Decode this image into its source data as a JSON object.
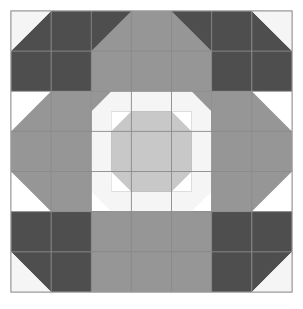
{
  "figure": {
    "kind": "quilt-block-diagram",
    "canvas": {
      "width": 303,
      "height": 309,
      "background": "#ffffff"
    }
  },
  "palette": {
    "dark_gray": "#4e4e4e",
    "medium_gray": "#969696",
    "light_gray": "#c8c8c8",
    "off_white": "#f5f5f5",
    "white": "#ffffff",
    "seam_line": "#8a8a8a",
    "border_line": "#9a9a9a"
  },
  "block": {
    "origin_x": 11,
    "origin_y": 11,
    "size": 281,
    "grid_cells": 7,
    "cell_size": 40.142857,
    "border_stroke_width": 1,
    "seam_stroke_width": 0.9
  },
  "structure": {
    "description": "Symmetric seven-by-seven cell quilt block with dark corner units, medium gray sashing, an off-white snowball ring and a light gray octagon at the center.",
    "corner_unit": "two-by-two dark gray square with off-white corner triangle",
    "edge_unit": "medium gray bar over off-white snowball",
    "center_unit": "light gray octagon on medium gray square"
  },
  "shapes": [
    {
      "name": "block-background",
      "kind": "rect",
      "fill": "#ffffff",
      "stroke": "#9a9a9a",
      "x": 11,
      "y": 11,
      "w": 281,
      "h": 281
    },
    {
      "name": "corner-tl-dark-square",
      "kind": "poly",
      "fill": "#4e4e4e",
      "points": "51.1,11 131.4,11 131.4,91.3 51.1,91.3"
    },
    {
      "name": "corner-tl-dark-wedge",
      "kind": "poly",
      "fill": "#4e4e4e",
      "points": "11,51.1 51.1,11 51.1,91.3 11,91.3"
    },
    {
      "name": "corner-tl-white-triangle",
      "kind": "poly",
      "fill": "#f5f5f5",
      "points": "11,11 51.1,11 11,51.1"
    },
    {
      "name": "corner-tl-notch-upper",
      "kind": "poly",
      "fill": "#ffffff",
      "points": "131.4,11 131.4,51.1 171.5,11"
    },
    {
      "name": "corner-tl-notch-lower",
      "kind": "poly",
      "fill": "#ffffff",
      "points": "11,91.3 51.1,91.3 11,131.4"
    },
    {
      "name": "corner-tl-dark-point-right",
      "kind": "poly",
      "fill": "#4e4e4e",
      "points": "131.4,51.1 171.5,91.3 131.4,91.3"
    },
    {
      "name": "corner-tl-dark-point-down",
      "kind": "poly",
      "fill": "#4e4e4e",
      "points": "51.1,91.3 91.3,131.4 51.1,131.4"
    },
    {
      "name": "corner-tr-dark-square",
      "kind": "poly",
      "fill": "#4e4e4e",
      "points": "171.5,11 251.8,11 251.8,91.3 171.5,91.3"
    },
    {
      "name": "corner-tr-dark-wedge",
      "kind": "poly",
      "fill": "#4e4e4e",
      "points": "251.8,11 292,51.1 292,91.3 251.8,91.3"
    },
    {
      "name": "corner-tr-white-triangle",
      "kind": "poly",
      "fill": "#f5f5f5",
      "points": "251.8,11 292,11 292,51.1"
    },
    {
      "name": "corner-tr-notch-lower",
      "kind": "poly",
      "fill": "#ffffff",
      "points": "251.8,91.3 292,91.3 292,131.4"
    },
    {
      "name": "corner-tr-dark-point-left",
      "kind": "poly",
      "fill": "#4e4e4e",
      "points": "171.5,51.1 171.5,91.3 131.4,91.3"
    },
    {
      "name": "corner-tr-dark-point-down",
      "kind": "poly",
      "fill": "#4e4e4e",
      "points": "251.8,91.3 251.8,131.4 211.6,131.4"
    },
    {
      "name": "corner-bl-dark-square",
      "kind": "poly",
      "fill": "#4e4e4e",
      "points": "51.1,211.6 131.4,211.6 131.4,292 51.1,292"
    },
    {
      "name": "corner-bl-dark-wedge",
      "kind": "poly",
      "fill": "#4e4e4e",
      "points": "11,211.6 51.1,211.6 51.1,292 11,251.8"
    },
    {
      "name": "corner-bl-white-triangle",
      "kind": "poly",
      "fill": "#f5f5f5",
      "points": "11,251.8 51.1,292 11,292"
    },
    {
      "name": "corner-bl-notch-upper",
      "kind": "poly",
      "fill": "#ffffff",
      "points": "11,171.5 51.1,211.6 11,211.6"
    },
    {
      "name": "corner-bl-dark-point-up",
      "kind": "poly",
      "fill": "#4e4e4e",
      "points": "51.1,171.5 91.3,171.5 51.1,211.6"
    },
    {
      "name": "corner-bl-dark-point-right",
      "kind": "poly",
      "fill": "#4e4e4e",
      "points": "131.4,211.6 171.5,211.6 131.4,251.8"
    },
    {
      "name": "corner-br-dark-square",
      "kind": "poly",
      "fill": "#4e4e4e",
      "points": "171.5,211.6 251.8,211.6 251.8,292 171.5,292"
    },
    {
      "name": "corner-br-dark-wedge",
      "kind": "poly",
      "fill": "#4e4e4e",
      "points": "251.8,211.6 292,211.6 292,251.8 251.8,292"
    },
    {
      "name": "corner-br-white-triangle",
      "kind": "poly",
      "fill": "#f5f5f5",
      "points": "292,251.8 292,292 251.8,292"
    },
    {
      "name": "corner-br-notch-upper",
      "kind": "poly",
      "fill": "#ffffff",
      "points": "251.8,171.5 292,171.5 292,211.6"
    },
    {
      "name": "corner-br-dark-point-up",
      "kind": "poly",
      "fill": "#4e4e4e",
      "points": "211.6,171.5 251.8,171.5 251.8,211.6"
    },
    {
      "name": "corner-br-dark-point-left",
      "kind": "poly",
      "fill": "#4e4e4e",
      "points": "131.4,211.6 171.5,251.8 131.4,251.8"
    },
    {
      "name": "edge-top-bar",
      "kind": "poly",
      "fill": "#969696",
      "points": "131.4,11 171.5,11 171.5,11 171.5,51.1 211.6,91.3 91.3,91.3 131.4,51.1"
    },
    {
      "name": "edge-top-bar-fill",
      "kind": "poly",
      "fill": "#969696",
      "points": "131.4,11 171.5,11 211.6,51.1 211.6,91.3 91.3,91.3 91.3,51.1"
    },
    {
      "name": "edge-top-snowball-bg",
      "kind": "poly",
      "fill": "#969696",
      "points": "91.3,91.3 211.6,91.3 211.6,131.4 91.3,131.4"
    },
    {
      "name": "edge-top-snowball",
      "kind": "poly",
      "fill": "#f5f5f5",
      "points": "111.4,91.3 191.5,91.3 211.6,111.4 211.6,131.4 91.3,131.4 91.3,111.4"
    },
    {
      "name": "edge-bottom-bar-fill",
      "kind": "poly",
      "fill": "#969696",
      "points": "91.3,251.8 211.6,251.8 211.6,292 171.5,292 131.4,292 91.3,292"
    },
    {
      "name": "edge-bottom-bar-top",
      "kind": "poly",
      "fill": "#969696",
      "points": "91.3,211.6 211.6,211.6 211.6,251.8 91.3,251.8"
    },
    {
      "name": "edge-bottom-snowball",
      "kind": "poly",
      "fill": "#f5f5f5",
      "points": "91.3,171.5 211.6,171.5 211.6,191.5 191.5,211.6 111.4,211.6 91.3,191.5"
    },
    {
      "name": "edge-left-bar",
      "kind": "poly",
      "fill": "#969696",
      "points": "11,131.4 51.1,91.3 91.3,91.3 91.3,211.6 51.1,211.6 11,171.5"
    },
    {
      "name": "edge-left-snowball",
      "kind": "poly",
      "fill": "#f5f5f5",
      "points": "131.4,111.4 151.5,131.4 151.5,171.5 131.4,191.5 111.4,191.5 91.3,171.5 91.3,131.4 111.4,111.4"
    },
    {
      "name": "edge-right-bar",
      "kind": "poly",
      "fill": "#969696",
      "points": "211.6,91.3 251.8,91.3 292,131.4 292,171.5 251.8,211.6 211.6,211.6"
    },
    {
      "name": "edge-right-snowball",
      "kind": "poly",
      "fill": "#f5f5f5",
      "points": "191.5,111.4 211.6,131.4 211.6,171.5 191.5,191.5 171.5,191.5 151.5,171.5 151.5,131.4 171.5,111.4"
    },
    {
      "name": "center-square",
      "kind": "rect",
      "fill": "#969696",
      "x": 111.4,
      "y": 111.4,
      "w": 80.2,
      "h": 80.2
    },
    {
      "name": "center-octagon",
      "kind": "poly",
      "fill": "#c8c8c8",
      "points": "131.4,111.4 171.5,111.4 191.5,131.4 191.5,171.5 171.5,191.5 131.4,191.5 111.4,171.5 111.4,131.4"
    },
    {
      "name": "center-corner-tl",
      "kind": "poly",
      "fill": "#ffffff",
      "points": "111.4,111.4 131.4,111.4 111.4,131.4"
    },
    {
      "name": "center-corner-tr",
      "kind": "poly",
      "fill": "#ffffff",
      "points": "171.5,111.4 191.5,111.4 191.5,131.4"
    },
    {
      "name": "center-corner-bl",
      "kind": "poly",
      "fill": "#ffffff",
      "points": "111.4,171.5 131.4,191.5 111.4,191.5"
    },
    {
      "name": "center-corner-br",
      "kind": "poly",
      "fill": "#ffffff",
      "points": "191.5,171.5 191.5,191.5 171.5,191.5"
    }
  ],
  "seams": {
    "vertical_x": [
      51.1,
      91.3,
      131.4,
      171.5,
      211.6,
      251.8
    ],
    "horizontal_y": [
      51.1,
      91.3,
      131.4,
      171.5,
      211.6,
      251.8
    ],
    "top": 11,
    "bottom": 292,
    "left": 11,
    "right": 292
  }
}
